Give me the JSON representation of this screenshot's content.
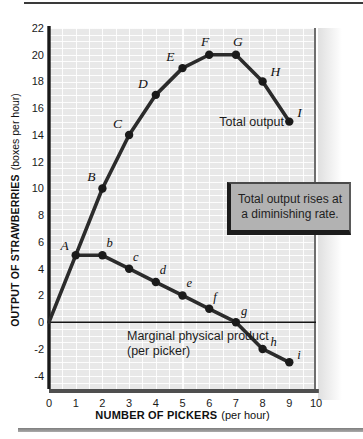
{
  "colors": {
    "curve": "#2b2b2b",
    "dot": "#1a1a1a",
    "panel_bg": "#e8e8e8",
    "grid_line": "#ffffff",
    "callout_bg": "#b2b2b2",
    "callout_border": "#1c1c1c",
    "rule_top": "#3a3a3a",
    "rule_bottom": "#8e8e8e",
    "text": "#1a1a1a"
  },
  "chart_data": {
    "type": "line",
    "title": "",
    "xlabel": "NUMBER OF PICKERS (per hour)",
    "ylabel": "OUTPUT OF STRAWBERRIES (boxes per hour)",
    "xlabel_bold": "NUMBER OF PICKERS",
    "xlabel_normal": "(per hour)",
    "ylabel_bold": "OUTPUT OF STRAWBERRIES",
    "ylabel_normal": "(boxes per hour)",
    "xlim": [
      0,
      10
    ],
    "ylim": [
      -4,
      22
    ],
    "xticks": [
      0,
      1,
      2,
      3,
      4,
      5,
      6,
      7,
      8,
      9,
      10
    ],
    "yticks": [
      22,
      20,
      18,
      16,
      14,
      12,
      10,
      8,
      6,
      4,
      2,
      0,
      -2,
      -4
    ],
    "grid": true,
    "legend_position": "inline-labels",
    "series": [
      {
        "name": "Total output",
        "x": [
          0,
          1,
          2,
          3,
          4,
          5,
          6,
          7,
          8,
          9
        ],
        "y": [
          0,
          5,
          10,
          14,
          17,
          19,
          20,
          20,
          18,
          15
        ],
        "point_labels": [
          "",
          "A",
          "B",
          "C",
          "D",
          "E",
          "F",
          "G",
          "H",
          "I"
        ]
      },
      {
        "name": "Marginal physical product (per picker)",
        "x": [
          1,
          2,
          3,
          4,
          5,
          6,
          7,
          8,
          9
        ],
        "y": [
          5,
          5,
          4,
          3,
          2,
          1,
          0,
          -2,
          -3
        ],
        "point_labels": [
          "",
          "b",
          "c",
          "d",
          "e",
          "f",
          "g",
          "h",
          "i"
        ]
      }
    ],
    "curve_labels": {
      "total": "Total output",
      "marginal_line1": "Marginal physical product",
      "marginal_line2": "(per picker)"
    },
    "callout": {
      "line1": "Total output rises at",
      "line2": "a diminishing rate."
    }
  }
}
